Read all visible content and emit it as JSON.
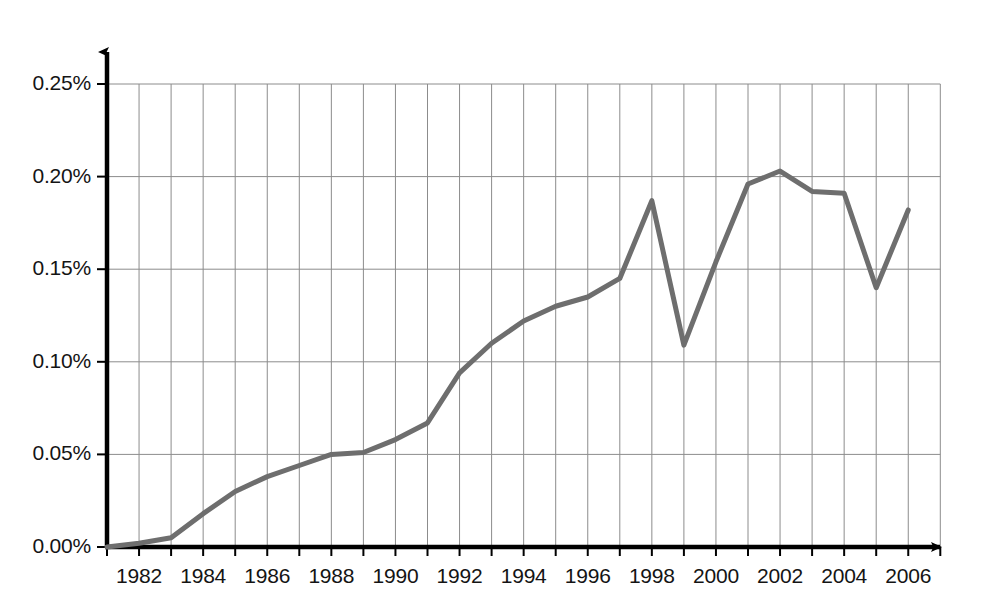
{
  "chart_data": {
    "type": "line",
    "title": "",
    "subtitle": "",
    "xlabel": "",
    "ylabel": "",
    "x": [
      1981,
      1982,
      1983,
      1984,
      1985,
      1986,
      1987,
      1988,
      1989,
      1990,
      1991,
      1992,
      1993,
      1994,
      1995,
      1996,
      1997,
      1998,
      1999,
      2000,
      2001,
      2002,
      2003,
      2004,
      2005,
      2006
    ],
    "values": [
      0.0,
      0.002,
      0.005,
      0.018,
      0.03,
      0.038,
      0.044,
      0.05,
      0.051,
      0.058,
      0.067,
      0.094,
      0.11,
      0.122,
      0.13,
      0.135,
      0.145,
      0.187,
      0.109,
      0.154,
      0.196,
      0.203,
      0.192,
      0.191,
      0.14,
      0.182
    ],
    "series": [
      {
        "name": "",
        "values": [
          0.0,
          0.002,
          0.005,
          0.018,
          0.03,
          0.038,
          0.044,
          0.05,
          0.051,
          0.058,
          0.067,
          0.094,
          0.11,
          0.122,
          0.13,
          0.135,
          0.145,
          0.187,
          0.109,
          0.154,
          0.196,
          0.203,
          0.192,
          0.191,
          0.14,
          0.182
        ],
        "color": "#6e6e6e"
      }
    ],
    "xlim": [
      1981,
      2006
    ],
    "ylim": [
      0.0,
      0.25
    ],
    "y_ticks": [
      0.0,
      0.05,
      0.1,
      0.15,
      0.2,
      0.25
    ],
    "y_tick_labels": [
      "0.00%",
      "0.05%",
      "0.10%",
      "0.15%",
      "0.20%",
      "0.25%"
    ],
    "x_ticks": [
      1981,
      1982,
      1983,
      1984,
      1985,
      1986,
      1987,
      1988,
      1989,
      1990,
      1991,
      1992,
      1993,
      1994,
      1995,
      1996,
      1997,
      1998,
      1999,
      2000,
      2001,
      2002,
      2003,
      2004,
      2005,
      2006
    ],
    "x_tick_labels": [
      "1982",
      "1984",
      "1986",
      "1988",
      "1990",
      "1992",
      "1994",
      "1996",
      "1998",
      "2000",
      "2002",
      "2004",
      "2006"
    ],
    "x_labeled_ticks": [
      1982,
      1984,
      1986,
      1988,
      1990,
      1992,
      1994,
      1996,
      1998,
      2000,
      2002,
      2004,
      2006
    ],
    "grid": {
      "vertical": true,
      "horizontal": true,
      "color": "#8c8c8c"
    },
    "legend": {
      "show": false,
      "position": "none",
      "entries": []
    },
    "axis_color": "#000000",
    "axis_arrows": true,
    "annotations": []
  }
}
